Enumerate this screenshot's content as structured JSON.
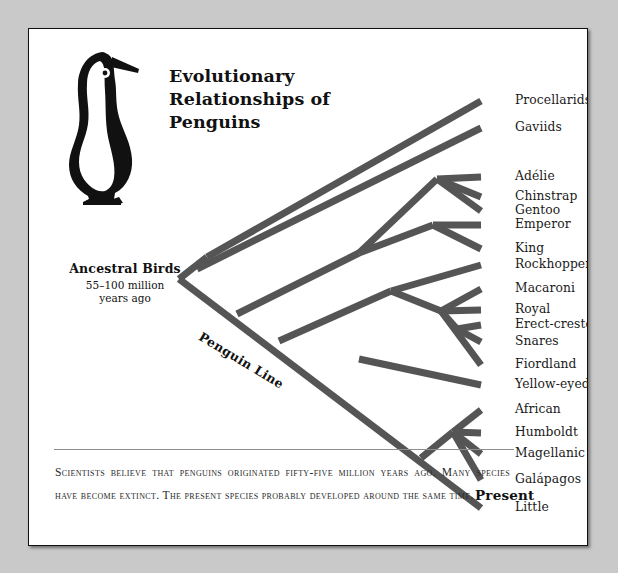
{
  "figure": {
    "title": "Evolutionary\nRelationships of\nPenguins",
    "title_line1": "Evolutionary",
    "title_line2": "Relationships of",
    "title_line3": "Penguins",
    "root_label": "Ancestral Birds",
    "root_sublabel_line1": "55–100 million",
    "root_sublabel_line2": "years ago",
    "trunk_label": "Penguin Line",
    "present_label": "Present",
    "caption": "Scientists believe that penguins originated fifty-five million years ago. Many species have become extinct. The present species probably developed around the same time.",
    "branch_color": "#555555",
    "frame_color": "#111111",
    "page_background": "#c9c9c9",
    "panel_background": "#ffffff"
  },
  "chart_data": {
    "type": "diagram",
    "subtype": "cladogram",
    "title": "Evolutionary Relationships of Penguins",
    "root": {
      "name": "Ancestral Birds",
      "age": "55–100 million years ago"
    },
    "axis": {
      "left": "Ancestral Birds",
      "right": "Present"
    },
    "tips": [
      {
        "id": "procellarids",
        "label": "Procellarids",
        "y": 72,
        "x": 486
      },
      {
        "id": "gaviids",
        "label": "Gaviids",
        "y": 99,
        "x": 486
      },
      {
        "id": "adelie",
        "label": "Adélie",
        "y": 148,
        "x": 486
      },
      {
        "id": "chinstrap",
        "label": "Chinstrap",
        "y": 168,
        "x": 486
      },
      {
        "id": "gentoo",
        "label": "Gentoo",
        "y": 182,
        "x": 486
      },
      {
        "id": "emperor",
        "label": "Emperor",
        "y": 196,
        "x": 486
      },
      {
        "id": "king",
        "label": "King",
        "y": 220,
        "x": 486
      },
      {
        "id": "rockhopper",
        "label": "Rockhopper",
        "y": 236,
        "x": 486
      },
      {
        "id": "macaroni",
        "label": "Macaroni",
        "y": 260,
        "x": 486
      },
      {
        "id": "royal",
        "label": "Royal",
        "y": 281,
        "x": 486
      },
      {
        "id": "erect-crested",
        "label": "Erect-crested",
        "y": 296,
        "x": 486
      },
      {
        "id": "snares",
        "label": "Snares",
        "y": 313,
        "x": 486
      },
      {
        "id": "fiordland",
        "label": "Fiordland",
        "y": 336,
        "x": 486
      },
      {
        "id": "yellow-eyed",
        "label": "Yellow-eyed",
        "y": 356,
        "x": 486
      },
      {
        "id": "african",
        "label": "African",
        "y": 381,
        "x": 486
      },
      {
        "id": "humboldt",
        "label": "Humboldt",
        "y": 404,
        "x": 486
      },
      {
        "id": "magellanic",
        "label": "Magellanic",
        "y": 425,
        "x": 486
      },
      {
        "id": "galapagos",
        "label": "Galápagos",
        "y": 451,
        "x": 486
      },
      {
        "id": "little",
        "label": "Little",
        "y": 479,
        "x": 486
      }
    ],
    "clades": [
      {
        "name": "Outgroup seabirds",
        "members": [
          "Procellarids",
          "Gaviids"
        ]
      },
      {
        "name": "Pygoscelis",
        "members": [
          "Adélie",
          "Chinstrap",
          "Gentoo"
        ]
      },
      {
        "name": "Aptenodytes",
        "members": [
          "Emperor",
          "King"
        ]
      },
      {
        "name": "Eudyptes",
        "members": [
          "Rockhopper",
          "Macaroni",
          "Royal",
          "Erect-crested",
          "Snares",
          "Fiordland"
        ]
      },
      {
        "name": "Megadyptes",
        "members": [
          "Yellow-eyed"
        ]
      },
      {
        "name": "Spheniscus",
        "members": [
          "African",
          "Humboldt",
          "Magellanic",
          "Galápagos"
        ]
      },
      {
        "name": "Eudyptula",
        "members": [
          "Little"
        ]
      }
    ]
  }
}
